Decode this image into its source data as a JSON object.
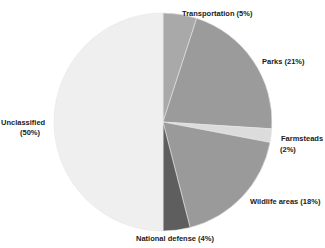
{
  "chart_data": {
    "type": "pie",
    "title": "",
    "start": "top",
    "direction": "clockwise",
    "slices": [
      {
        "name": "Transportation",
        "value": 5,
        "label": "Transportation (5%)",
        "color": "#a9a9a9"
      },
      {
        "name": "Parks",
        "value": 21,
        "label": "Parks (21%)",
        "color": "#9b9b9b"
      },
      {
        "name": "Farmsteads",
        "value": 2,
        "label_lines": [
          "Farmsteads",
          "(2%)"
        ],
        "color": "#dcdcdc"
      },
      {
        "name": "Wildlife areas",
        "value": 18,
        "label": "Wildlife areas (18%)",
        "color": "#9a9a9a"
      },
      {
        "name": "National defense",
        "value": 4,
        "label": "National defense (4%)",
        "color": "#5e5e5e"
      },
      {
        "name": "Unclassified",
        "value": 50,
        "label_lines": [
          "Unclassified",
          "(50%)"
        ],
        "color": "#efefef"
      }
    ]
  }
}
